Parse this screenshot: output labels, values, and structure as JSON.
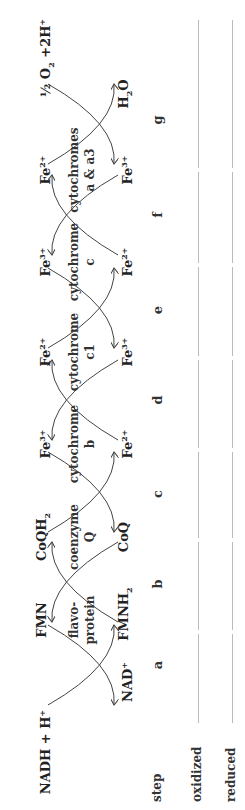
{
  "top_row": [
    {
      "text": "NADH + H",
      "sup": "+",
      "x": 58
    },
    {
      "text": "FMN",
      "x": 190
    },
    {
      "text": "CoQH",
      "sub": "2",
      "x": 273
    },
    {
      "text": "Fe",
      "sup": "3+",
      "x": 366
    },
    {
      "text": "Fe",
      "sup": "2+",
      "x": 458
    },
    {
      "text": "Fe",
      "sup": "3+",
      "x": 548
    },
    {
      "text": "Fe",
      "sup": "2+",
      "x": 640
    },
    {
      "text": "½ O",
      "sub": "2",
      "after": " +2H",
      "sup": "+",
      "x": 752
    }
  ],
  "bottom_row": [
    {
      "text": "NAD",
      "sup": "+",
      "x": 128
    },
    {
      "text": "FMNH",
      "sub": "2",
      "x": 196
    },
    {
      "text": "CoQ",
      "x": 273
    },
    {
      "text": "Fe",
      "sup": "2+",
      "x": 366
    },
    {
      "text": "Fe",
      "sup": "3+",
      "x": 458
    },
    {
      "text": "Fe",
      "sup": "2+",
      "x": 548
    },
    {
      "text": "Fe",
      "sup": "3+",
      "x": 640
    },
    {
      "text": "H",
      "sub": "2",
      "after": "O",
      "x": 716
    }
  ],
  "carriers": [
    {
      "line1": "flavo-",
      "line2": "protein",
      "x": 190
    },
    {
      "line1": "coenzyme",
      "line2": "Q",
      "x": 273
    },
    {
      "line1": "cytochrome",
      "line2": "b",
      "x": 366
    },
    {
      "line1": "cytochrome",
      "line2": "c1",
      "x": 458
    },
    {
      "line1": "cytochrome",
      "line2": "c",
      "x": 548
    },
    {
      "line1": "cytochromes",
      "line2": "a & a3",
      "x": 640
    }
  ],
  "steps": {
    "label": "step",
    "items": [
      {
        "letter": "a",
        "x": 145
      },
      {
        "letter": "b",
        "x": 226
      },
      {
        "letter": "c",
        "x": 316
      },
      {
        "letter": "d",
        "x": 410
      },
      {
        "letter": "e",
        "x": 500
      },
      {
        "letter": "f",
        "x": 595
      },
      {
        "letter": "g",
        "x": 690
      }
    ]
  },
  "answer_rows": [
    {
      "label": "oxidized",
      "y": 198
    },
    {
      "label": "reduced",
      "y": 232
    }
  ],
  "crossings": [
    {
      "x": 145,
      "arrows": "bottom"
    },
    {
      "x": 228,
      "arrows": "top"
    },
    {
      "x": 318,
      "arrows": "bottom"
    },
    {
      "x": 410,
      "arrows": "top"
    },
    {
      "x": 502,
      "arrows": "bottom"
    },
    {
      "x": 595,
      "arrows": "top"
    },
    {
      "x": 686,
      "arrows": "bottom"
    }
  ],
  "colors": {
    "line": "#bbbbbb",
    "arc": "#444444",
    "text": "#222222"
  }
}
